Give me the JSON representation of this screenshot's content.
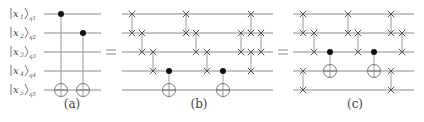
{
  "wires_y": [
    14,
    33,
    52,
    71,
    90
  ],
  "labels": [
    {
      "ket": "x",
      "idx": "1",
      "q": "q1"
    },
    {
      "ket": "x",
      "idx": "2",
      "q": "q2"
    },
    {
      "ket": "x",
      "idx": "3",
      "q": "q3"
    },
    {
      "ket": "x",
      "idx": "4",
      "q": "q4"
    },
    {
      "ket": "x",
      "idx": "5",
      "q": "q5"
    }
  ],
  "equals": [
    {
      "x": 111
    },
    {
      "x": 283
    }
  ],
  "circuits": [
    {
      "id": "a",
      "caption": "(a)",
      "caption_x": 72,
      "x0": 44,
      "x1": 101,
      "gates": [
        {
          "type": "cnot",
          "x": 61,
          "c": 0,
          "t": 4
        },
        {
          "type": "cnot",
          "x": 83,
          "c": 1,
          "t": 4
        }
      ]
    },
    {
      "id": "b",
      "caption": "(b)",
      "caption_x": 199,
      "x0": 122,
      "x1": 273,
      "gates": [
        {
          "type": "swap",
          "x": 132,
          "a": 0,
          "b": 1
        },
        {
          "type": "swap",
          "x": 142,
          "a": 1,
          "b": 2
        },
        {
          "type": "swap",
          "x": 153,
          "a": 2,
          "b": 3
        },
        {
          "type": "cnot",
          "x": 169,
          "c": 3,
          "t": 4
        },
        {
          "type": "swap",
          "x": 186,
          "a": 0,
          "b": 1
        },
        {
          "type": "swap",
          "x": 196,
          "a": 1,
          "b": 2
        },
        {
          "type": "swap",
          "x": 207,
          "a": 2,
          "b": 3
        },
        {
          "type": "cnot",
          "x": 223,
          "c": 3,
          "t": 4
        },
        {
          "type": "swap",
          "x": 241,
          "a": 1,
          "b": 2
        },
        {
          "type": "swap",
          "x": 251,
          "a": 0,
          "b": 1
        },
        {
          "type": "swap",
          "x": 251,
          "a": 2,
          "b": 3
        },
        {
          "type": "swap",
          "x": 261,
          "a": 1,
          "b": 2
        }
      ]
    },
    {
      "id": "c",
      "caption": "(c)",
      "caption_x": 355,
      "x0": 293,
      "x1": 414,
      "gates": [
        {
          "type": "swap",
          "x": 303,
          "a": 0,
          "b": 1
        },
        {
          "type": "swap",
          "x": 303,
          "a": 3,
          "b": 4
        },
        {
          "type": "swap",
          "x": 314,
          "a": 1,
          "b": 2
        },
        {
          "type": "cnot",
          "x": 330,
          "c": 2,
          "t": 3
        },
        {
          "type": "swap",
          "x": 348,
          "a": 0,
          "b": 1
        },
        {
          "type": "swap",
          "x": 358,
          "a": 1,
          "b": 2
        },
        {
          "type": "cnot",
          "x": 374,
          "c": 2,
          "t": 3
        },
        {
          "type": "swap",
          "x": 391,
          "a": 0,
          "b": 1
        },
        {
          "type": "swap",
          "x": 391,
          "a": 3,
          "b": 4
        },
        {
          "type": "swap",
          "x": 402,
          "a": 1,
          "b": 2
        }
      ]
    }
  ],
  "caption_y": 108
}
